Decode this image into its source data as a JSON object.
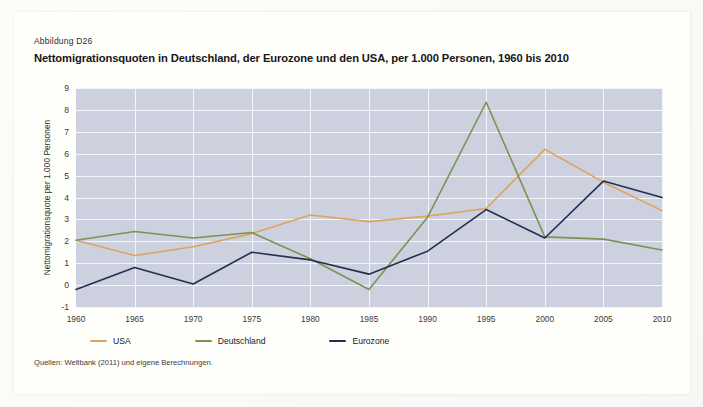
{
  "figure": {
    "label": "Abbildung D26",
    "title": "Nettomigrationsquoten in Deutschland, der Eurozone und den USA, per 1.000 Personen, 1960 bis 2010",
    "source": "Quellen: Weltbank (2011) und eigene Berechnungen."
  },
  "colors": {
    "plot_background": "#ccd0df",
    "gridline": "#f4f5fa",
    "page_background": "#fefefb",
    "usa": "#e0a košt",
    "usa_line": "#dfa45c",
    "deutschland_line": "#7d9351",
    "eurozone_line": "#232f52"
  },
  "chart_data": {
    "type": "line",
    "title": "Nettomigrationsquoten in Deutschland, der Eurozone und den USA, per 1.000 Personen, 1960 bis 2010",
    "xlabel": "",
    "ylabel": "Nettomigrationsquote per 1.000 Personen",
    "x": [
      1960,
      1965,
      1970,
      1975,
      1980,
      1985,
      1990,
      1995,
      2000,
      2005,
      2010
    ],
    "xtick_labels": [
      "1960",
      "1965",
      "1970",
      "1975",
      "1980",
      "1985",
      "1990",
      "1995",
      "2000",
      "2005",
      "2010"
    ],
    "ytick_labels": [
      "-1",
      "0",
      "1",
      "2",
      "3",
      "4",
      "5",
      "6",
      "7",
      "8",
      "9"
    ],
    "yticks": [
      -1,
      0,
      1,
      2,
      3,
      4,
      5,
      6,
      7,
      8,
      9
    ],
    "ylim": [
      -1,
      9
    ],
    "xlim": [
      1960,
      2010
    ],
    "grid": true,
    "legend_position": "below",
    "series": [
      {
        "name": "USA",
        "color": "#dfa45c",
        "values": [
          2.05,
          1.35,
          1.75,
          2.35,
          3.2,
          2.9,
          3.15,
          3.5,
          6.2,
          4.7,
          3.4
        ]
      },
      {
        "name": "Deutschland",
        "color": "#7d9351",
        "values": [
          2.05,
          2.45,
          2.15,
          2.4,
          1.2,
          -0.2,
          3.1,
          8.35,
          2.2,
          2.1,
          1.6
        ]
      },
      {
        "name": "Eurozone",
        "color": "#232f52",
        "values": [
          -0.2,
          0.8,
          0.05,
          1.5,
          1.15,
          0.5,
          1.55,
          3.45,
          2.15,
          4.75,
          4.0
        ]
      }
    ]
  },
  "legend": [
    {
      "label": "USA",
      "color": "#dfa45c"
    },
    {
      "label": "Deutschland",
      "color": "#7d9351"
    },
    {
      "label": "Eurozone",
      "color": "#232f52"
    }
  ]
}
